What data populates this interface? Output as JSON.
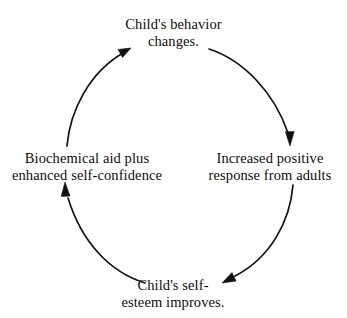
{
  "diagram": {
    "type": "cycle",
    "direction": "clockwise",
    "background_color": "#ffffff",
    "stroke_color": "#111111",
    "nodes": [
      {
        "id": "child-behavior-changes",
        "position": "top",
        "line1": "Child's behavior",
        "line2": "changes."
      },
      {
        "id": "increased-positive-response",
        "position": "right",
        "line1": "Increased positive",
        "line2": "response from adults"
      },
      {
        "id": "child-self-esteem-improves",
        "position": "bottom",
        "line1": "Child's self-",
        "line2": "esteem improves."
      },
      {
        "id": "biochemical-aid-self-confidence",
        "position": "left",
        "line1": "Biochemical aid plus",
        "line2": "enhanced self-confidence"
      }
    ],
    "arrows": [
      {
        "id": "top-to-right",
        "from": "child-behavior-changes",
        "to": "increased-positive-response",
        "head": "down"
      },
      {
        "id": "right-to-bottom",
        "from": "increased-positive-response",
        "to": "child-self-esteem-improves",
        "head": "down-left"
      },
      {
        "id": "bottom-to-left",
        "from": "child-self-esteem-improves",
        "to": "biochemical-aid-self-confidence",
        "head": "up"
      },
      {
        "id": "left-to-top",
        "from": "biochemical-aid-self-confidence",
        "to": "child-behavior-changes",
        "head": "up-right"
      }
    ]
  }
}
